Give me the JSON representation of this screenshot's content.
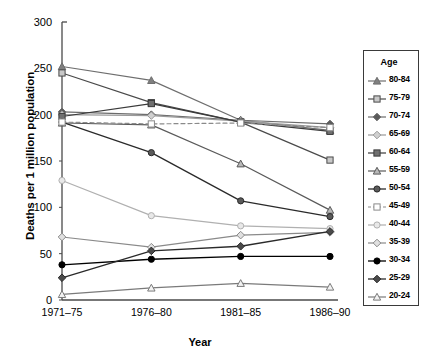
{
  "chart_data": {
    "type": "line",
    "title": "",
    "xlabel": "Year",
    "ylabel": "Deaths per 1 million population",
    "categories": [
      "1971–75",
      "1976–80",
      "1981–85",
      "1986–90"
    ],
    "ylim": [
      0,
      300
    ],
    "yticks": [
      0,
      50,
      100,
      150,
      200,
      250,
      300
    ],
    "grid": false,
    "legend_position": "right-outside",
    "legend_title": "Age",
    "series": [
      {
        "name": "80-84",
        "values": [
          252,
          237,
          194,
          183
        ],
        "marker": "triangle-up",
        "fill": "#808080",
        "stroke": "#6e6e6e",
        "width": 1.2,
        "dash": "none"
      },
      {
        "name": "75-79",
        "values": [
          245,
          213,
          192,
          151
        ],
        "marker": "square",
        "fill": "#c8c8c8",
        "stroke": "#4a4a4a",
        "width": 1.2,
        "dash": "none"
      },
      {
        "name": "70-74",
        "values": [
          203,
          200,
          194,
          190
        ],
        "marker": "diamond",
        "fill": "#5a5a5a",
        "stroke": "#6b6b6b",
        "width": 1.2,
        "dash": "none"
      },
      {
        "name": "65-69",
        "values": [
          200,
          199,
          193,
          186
        ],
        "marker": "diamond",
        "fill": "#d0d0d0",
        "stroke": "#9a9a9a",
        "width": 1.2,
        "dash": "none"
      },
      {
        "name": "60-64",
        "values": [
          198,
          212,
          192,
          182
        ],
        "marker": "square",
        "fill": "#707070",
        "stroke": "#3a3a3a",
        "width": 1.2,
        "dash": "none"
      },
      {
        "name": "55-59",
        "values": [
          191,
          189,
          147,
          97
        ],
        "marker": "triangle-up",
        "fill": "#b8b8b8",
        "stroke": "#5a5a5a",
        "width": 1.2,
        "dash": "none"
      },
      {
        "name": "50-54",
        "values": [
          192,
          159,
          107,
          90
        ],
        "marker": "circle",
        "fill": "#5a5a5a",
        "stroke": "#2a2a2a",
        "width": 1.3,
        "dash": "none"
      },
      {
        "name": "45-49",
        "values": [
          192,
          190,
          191,
          186
        ],
        "marker": "square-open",
        "fill": "#ffffff",
        "stroke": "#8a8a8a",
        "width": 1.2,
        "dash": "4,3"
      },
      {
        "name": "40-44",
        "values": [
          129,
          91,
          80,
          77
        ],
        "marker": "circle-open",
        "fill": "#e8e8e8",
        "stroke": "#b0b0b0",
        "width": 1.2,
        "dash": "none"
      },
      {
        "name": "35-39",
        "values": [
          68,
          57,
          70,
          73
        ],
        "marker": "diamond-open",
        "fill": "#e0e0e0",
        "stroke": "#8a8a8a",
        "width": 1.2,
        "dash": "none"
      },
      {
        "name": "30-34",
        "values": [
          38,
          44,
          47,
          47
        ],
        "marker": "circle-filled",
        "fill": "#000000",
        "stroke": "#000000",
        "width": 1.3,
        "dash": "none"
      },
      {
        "name": "25-29",
        "values": [
          24,
          53,
          58,
          74
        ],
        "marker": "diamond",
        "fill": "#4a4a4a",
        "stroke": "#2a2a2a",
        "width": 1.3,
        "dash": "none"
      },
      {
        "name": "20-24",
        "values": [
          6,
          13,
          18,
          14
        ],
        "marker": "triangle-open",
        "fill": "#f2f2f2",
        "stroke": "#7a7a7a",
        "width": 1.2,
        "dash": "none"
      }
    ]
  },
  "axes": {
    "y_tick_labels": [
      "300",
      "250",
      "200",
      "150",
      "100",
      "50",
      "0"
    ],
    "x_tick_labels": [
      "1971–75",
      "1976–80",
      "1981–85",
      "1986–90"
    ],
    "y_axis_title": "Deaths per 1 million population",
    "x_axis_title": "Year"
  },
  "legend": {
    "title": "Age",
    "items": [
      {
        "label": "80-84"
      },
      {
        "label": "75-79"
      },
      {
        "label": "70-74"
      },
      {
        "label": "65-69"
      },
      {
        "label": "60-64"
      },
      {
        "label": "55-59"
      },
      {
        "label": "50-54"
      },
      {
        "label": "45-49"
      },
      {
        "label": "40-44"
      },
      {
        "label": "35-39"
      },
      {
        "label": "30-34"
      },
      {
        "label": "25-29"
      },
      {
        "label": "20-24"
      }
    ]
  },
  "colors": {
    "axis": "#4a4a4a",
    "text": "#000000",
    "background": "#ffffff",
    "legend_border": "#3a3a3a"
  }
}
